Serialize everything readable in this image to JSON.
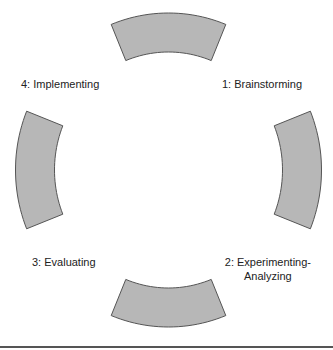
{
  "diagram": {
    "type": "cycle",
    "center": [
      168.5,
      170
    ],
    "outer_radius": [
      153,
      157
    ],
    "inner_radius": [
      114,
      118
    ],
    "half_span_deg": 22,
    "fill_color": "#b7b7b7",
    "stroke_color": "#555555",
    "segments": [
      {
        "position": "top",
        "angle": -90
      },
      {
        "position": "right",
        "angle": 0
      },
      {
        "position": "bottom",
        "angle": 90
      },
      {
        "position": "left",
        "angle": 180
      }
    ],
    "labels": {
      "brainstorming": "1: Brainstorming",
      "experimenting_line1": "2: Experimenting-",
      "experimenting_line2": "Analyzing",
      "evaluating": "3: Evaluating",
      "implementing": "4: Implementing"
    }
  }
}
